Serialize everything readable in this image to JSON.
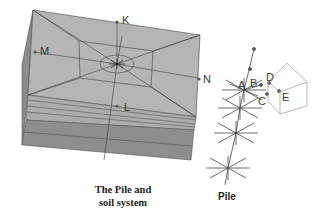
{
  "figure": {
    "soil_labels": {
      "K": "K",
      "M": "M",
      "N": "N",
      "L": "L"
    },
    "pile_labels": {
      "A": "A",
      "B": "B",
      "C": "C",
      "D": "D",
      "E": "E"
    },
    "captions": {
      "soil_line1": "The Pile and",
      "soil_line2": "soil system",
      "pile": "Pile"
    },
    "colors": {
      "soil_top": "#b4b4b4",
      "soil_layers": "#aaaaaa",
      "soil_deep": "#8a8a8a",
      "mesh_lines": "#404040",
      "house_lines": "#9a9a9a"
    }
  }
}
